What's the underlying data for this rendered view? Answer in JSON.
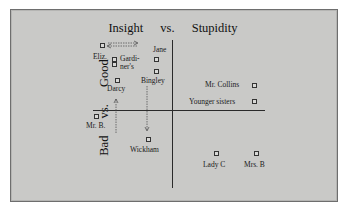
{
  "diagram": {
    "title": {
      "left": "Insight",
      "mid": "vs.",
      "right": "Stupidity"
    },
    "y_axis": {
      "bottom": "Bad",
      "mid": "vs.",
      "top": "Good"
    },
    "points": [
      {
        "id": "eliz",
        "label": "Eliz."
      },
      {
        "id": "gardiners",
        "label": "Gardi-\nner's",
        "label_line1": "Gardi-",
        "label_line2": "ner's"
      },
      {
        "id": "jane",
        "label": "Jane"
      },
      {
        "id": "bingley",
        "label": "Bingley"
      },
      {
        "id": "darcy",
        "label": "Darcy"
      },
      {
        "id": "mr-collins",
        "label": "Mr. Collins"
      },
      {
        "id": "younger-sisters",
        "label": "Younger sisters"
      },
      {
        "id": "mr-b",
        "label": "Mr. B."
      },
      {
        "id": "wickham",
        "label": "Wickham"
      },
      {
        "id": "lady-c",
        "label": "Lady C"
      },
      {
        "id": "mrs-b",
        "label": "Mrs. B"
      }
    ],
    "arrows": [
      {
        "id": "eliz-to-right",
        "description": "dotted arrow from Eliz. pointing left/right"
      },
      {
        "id": "darcy-up",
        "description": "dotted arrow rising toward Darcy"
      },
      {
        "id": "wickham-down",
        "description": "dotted arrow falling toward Wickham"
      }
    ],
    "colors": {
      "background": "#c9c9c7",
      "frame": "#6e6e6e",
      "ink": "#1a1a1a"
    }
  }
}
